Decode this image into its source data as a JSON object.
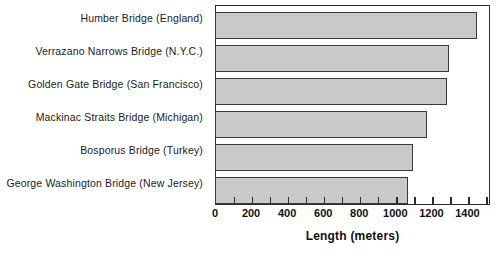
{
  "chart_data": {
    "type": "bar",
    "orientation": "horizontal",
    "title": "",
    "xlabel": "Length (meters)",
    "ylabel": "",
    "xlim": [
      0,
      1525
    ],
    "grid": false,
    "legend": null,
    "axis_tick_labels": [
      "0",
      "200",
      "400",
      "600",
      "800",
      "1000",
      "1200",
      "1400"
    ],
    "axis_tick_values": [
      0,
      200,
      400,
      600,
      800,
      1000,
      1200,
      1400
    ],
    "minor_tick_interval": 100,
    "categories": [
      "Humber Bridge (England)",
      "Verrazano Narrows Bridge (N.Y.C.)",
      "Golden Gate Bridge (San Francisco)",
      "Mackinac Straits Bridge (Michigan)",
      "Bosporus Bridge (Turkey)",
      "George Washington Bridge (New Jersey)"
    ],
    "values": [
      1450,
      1290,
      1280,
      1170,
      1095,
      1065
    ],
    "bar_fill_color": "#c9c9c9",
    "bar_edge_color": "#3a3a3a"
  }
}
